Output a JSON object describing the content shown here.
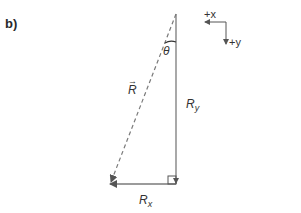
{
  "part_label": "b)",
  "labels": {
    "resultant": "R",
    "resultant_arrow": "→",
    "ry_main": "R",
    "ry_sub": "y",
    "rx_main": "R",
    "rx_sub": "x",
    "angle": "θ"
  },
  "axes_indicator": {
    "x_label": "+x",
    "y_label": "+y"
  },
  "colors": {
    "line": "#7a7a7a",
    "text": "#333333",
    "arrowhead": "#555555"
  }
}
